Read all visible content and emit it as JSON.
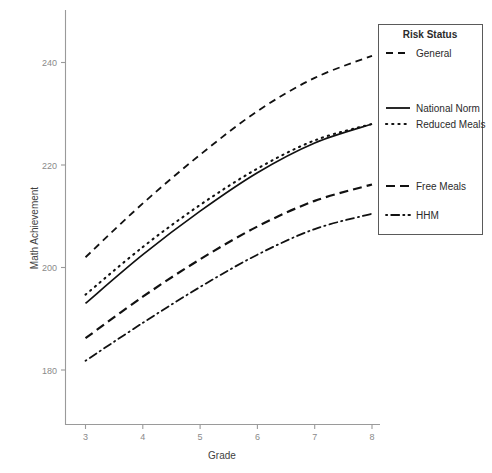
{
  "chart_data": {
    "type": "line",
    "title": "",
    "xlabel": "Grade",
    "ylabel": "Math Achievement",
    "xlim": [
      2.8,
      8.25
    ],
    "ylim": [
      176,
      246
    ],
    "xticks": [
      3,
      4,
      5,
      6,
      7,
      8
    ],
    "xtick_labels": [
      "3",
      "4",
      "5",
      "6",
      "7",
      "8"
    ],
    "yticks": [
      180,
      200,
      220,
      240
    ],
    "ytick_labels": [
      "180",
      "200",
      "220",
      "240"
    ],
    "grid": false,
    "legend_title": "Risk Status",
    "legend_position": "right",
    "x": [
      3,
      4,
      5,
      6,
      7,
      8
    ],
    "series": [
      {
        "name": "General",
        "style": "dashed",
        "values": [
          202.0,
          212.5,
          222.0,
          230.5,
          237.0,
          241.3
        ]
      },
      {
        "name": "National Norm",
        "style": "solid",
        "values": [
          193.0,
          202.5,
          211.0,
          218.5,
          224.3,
          228.0
        ]
      },
      {
        "name": "Reduced Meals",
        "style": "dotted",
        "values": [
          194.7,
          204.0,
          212.2,
          219.3,
          224.8,
          228.0
        ]
      },
      {
        "name": "Free Meals",
        "style": "longdash",
        "values": [
          186.2,
          194.3,
          201.6,
          208.0,
          213.0,
          216.2
        ]
      },
      {
        "name": "HHM",
        "style": "dashdot",
        "values": [
          181.8,
          189.2,
          196.2,
          202.5,
          207.5,
          210.5
        ]
      }
    ]
  },
  "axes": {
    "x_title": "Grade",
    "y_title": "Math Achievement"
  },
  "legend": {
    "title": "Risk Status",
    "entries": [
      {
        "label": "General",
        "style": "dashed"
      },
      {
        "label": "National Norm",
        "style": "solid"
      },
      {
        "label": "Reduced Meals",
        "style": "dotted"
      },
      {
        "label": "Free Meals",
        "style": "longdash"
      },
      {
        "label": "HHM",
        "style": "dashdot"
      }
    ]
  },
  "colors": {
    "line": "#111111",
    "axis": "#9a9a9a",
    "tick_text": "#8a8a8a",
    "title_text": "#2b2b2b",
    "background": "#ffffff"
  }
}
